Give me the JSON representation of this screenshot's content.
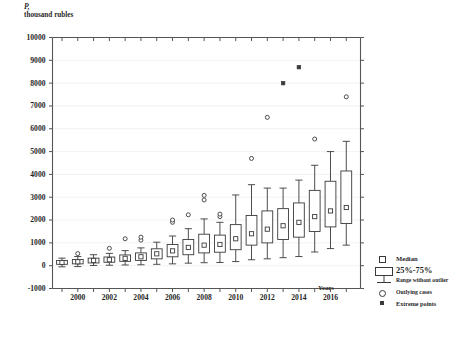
{
  "chart_data": {
    "type": "box",
    "title": "",
    "ylabel_line1": "P,",
    "ylabel_line2": "thousand rubles",
    "xlabel": "Years",
    "ylim": [
      -1000,
      10000
    ],
    "ytick_values": [
      -1000,
      0,
      1000,
      2000,
      3000,
      4000,
      5000,
      6000,
      7000,
      8000,
      9000,
      10000
    ],
    "ytick_labels": [
      "-1000",
      "0",
      "1000",
      "2000",
      "3000",
      "4000",
      "5000",
      "6000",
      "7000",
      "8000",
      "9000",
      "10000"
    ],
    "xlim": [
      1998.4,
      2017.9
    ],
    "xtick_values": [
      1999,
      2000,
      2001,
      2002,
      2003,
      2004,
      2005,
      2006,
      2007,
      2008,
      2009,
      2010,
      2011,
      2012,
      2013,
      2014,
      2015,
      2016,
      2017
    ],
    "xtick_labels": [
      "2000",
      "2002",
      "2004",
      "2006",
      "2008",
      "2010",
      "2012",
      "2014",
      "2016"
    ],
    "xtick_label_values": [
      2000,
      2002,
      2004,
      2006,
      2008,
      2010,
      2012,
      2014,
      2016
    ],
    "grid": true,
    "grid_color": "#efefef",
    "frame_color": "#555555",
    "series_color": "#3a3a3a",
    "categories": [
      1999,
      2000,
      2001,
      2002,
      2003,
      2004,
      2005,
      2006,
      2007,
      2008,
      2009,
      2010,
      2011,
      2012,
      2013,
      2014,
      2015,
      2016,
      2017
    ],
    "boxes": [
      {
        "x": 1999,
        "whisker_low": -50,
        "q1": 60,
        "median": 140,
        "q3": 230,
        "whisker_high": 330,
        "outliers": [],
        "extremes": []
      },
      {
        "x": 2000,
        "whisker_low": -40,
        "q1": 80,
        "median": 170,
        "q3": 270,
        "whisker_high": 400,
        "outliers": [
          530
        ],
        "extremes": []
      },
      {
        "x": 2001,
        "whisker_low": 10,
        "q1": 120,
        "median": 230,
        "q3": 330,
        "whisker_high": 480,
        "outliers": [],
        "extremes": []
      },
      {
        "x": 2002,
        "whisker_low": 20,
        "q1": 150,
        "median": 260,
        "q3": 380,
        "whisker_high": 540,
        "outliers": [
          760
        ],
        "extremes": []
      },
      {
        "x": 2003,
        "whisker_low": 30,
        "q1": 190,
        "median": 320,
        "q3": 470,
        "whisker_high": 660,
        "outliers": [
          1180
        ],
        "extremes": []
      },
      {
        "x": 2004,
        "whisker_low": 40,
        "q1": 230,
        "median": 390,
        "q3": 560,
        "whisker_high": 780,
        "outliers": [
          1120,
          1250
        ],
        "extremes": []
      },
      {
        "x": 2005,
        "whisker_low": 60,
        "q1": 300,
        "median": 520,
        "q3": 740,
        "whisker_high": 1030,
        "outliers": [],
        "extremes": []
      },
      {
        "x": 2006,
        "whisker_low": 80,
        "q1": 390,
        "median": 650,
        "q3": 930,
        "whisker_high": 1300,
        "outliers": [
          1900,
          2000
        ],
        "extremes": []
      },
      {
        "x": 2007,
        "whisker_low": 110,
        "q1": 480,
        "median": 800,
        "q3": 1150,
        "whisker_high": 1620,
        "outliers": [
          2230
        ],
        "extremes": []
      },
      {
        "x": 2008,
        "whisker_low": 130,
        "q1": 560,
        "median": 900,
        "q3": 1380,
        "whisker_high": 2050,
        "outliers": [
          2880,
          3080
        ],
        "extremes": []
      },
      {
        "x": 2009,
        "whisker_low": 140,
        "q1": 590,
        "median": 930,
        "q3": 1340,
        "whisker_high": 1900,
        "outliers": [
          2150,
          2260
        ],
        "extremes": []
      },
      {
        "x": 2010,
        "whisker_low": 180,
        "q1": 700,
        "median": 1180,
        "q3": 1800,
        "whisker_high": 3100,
        "outliers": [],
        "extremes": []
      },
      {
        "x": 2011,
        "whisker_low": 260,
        "q1": 900,
        "median": 1400,
        "q3": 2200,
        "whisker_high": 3550,
        "outliers": [
          4700
        ],
        "extremes": []
      },
      {
        "x": 2012,
        "whisker_low": 300,
        "q1": 1000,
        "median": 1600,
        "q3": 2400,
        "whisker_high": 3400,
        "outliers": [
          6500
        ],
        "extremes": []
      },
      {
        "x": 2013,
        "whisker_low": 350,
        "q1": 1150,
        "median": 1750,
        "q3": 2500,
        "whisker_high": 3400,
        "outliers": [],
        "extremes": [
          8000
        ]
      },
      {
        "x": 2014,
        "whisker_low": 400,
        "q1": 1250,
        "median": 1900,
        "q3": 2750,
        "whisker_high": 3750,
        "outliers": [],
        "extremes": [
          8700
        ]
      },
      {
        "x": 2015,
        "whisker_low": 600,
        "q1": 1500,
        "median": 2150,
        "q3": 3300,
        "whisker_high": 4400,
        "outliers": [
          5550
        ],
        "extremes": []
      },
      {
        "x": 2016,
        "whisker_low": 750,
        "q1": 1700,
        "median": 2400,
        "q3": 3700,
        "whisker_high": 5000,
        "outliers": [],
        "extremes": []
      },
      {
        "x": 2017,
        "whisker_low": 900,
        "q1": 1850,
        "median": 2550,
        "q3": 4150,
        "whisker_high": 5450,
        "outliers": [
          7400
        ],
        "extremes": []
      }
    ],
    "legend": {
      "position": "right-bottom",
      "items": [
        {
          "key": "median",
          "label": "Median",
          "symbol": "open-square"
        },
        {
          "key": "box",
          "label": "25%-75%",
          "symbol": "box"
        },
        {
          "key": "range",
          "label": "Range without outlier",
          "symbol": "whisker"
        },
        {
          "key": "outlier",
          "label": "Outlying cases",
          "symbol": "open-circle"
        },
        {
          "key": "extreme",
          "label": "Extreme points",
          "symbol": "filled-square"
        }
      ]
    }
  }
}
